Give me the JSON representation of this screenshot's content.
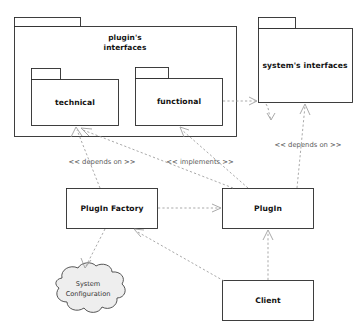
{
  "diagram": {
    "background_color": "#ffffff",
    "line_color": "#9a9a9a",
    "shape_stroke_color": "#2b2b2b",
    "cloud_fill_color": "#eeeeee",
    "packages": [
      {
        "id": "plugins-interfaces",
        "label_line1": "plugin's",
        "label_line2": "interfaces",
        "label": "plugin's interfaces"
      },
      {
        "id": "technical",
        "label": "technical"
      },
      {
        "id": "functional",
        "label": "functional"
      },
      {
        "id": "systems-interfaces",
        "label": "system's interfaces"
      }
    ],
    "classes": [
      {
        "id": "plugin-factory",
        "label": "PlugIn Factory"
      },
      {
        "id": "plugin",
        "label": "PlugIn"
      },
      {
        "id": "client",
        "label": "Client"
      }
    ],
    "cloud": {
      "id": "system-configuration",
      "label_line1": "System",
      "label_line2": "Configuration",
      "label": "System Configuration"
    },
    "edge_labels": [
      {
        "id": "depends-on-left",
        "text": "<< depends on >>"
      },
      {
        "id": "implements",
        "text": "<< implements >>"
      },
      {
        "id": "depends-on-right",
        "text": "<< depends on >>"
      }
    ]
  }
}
